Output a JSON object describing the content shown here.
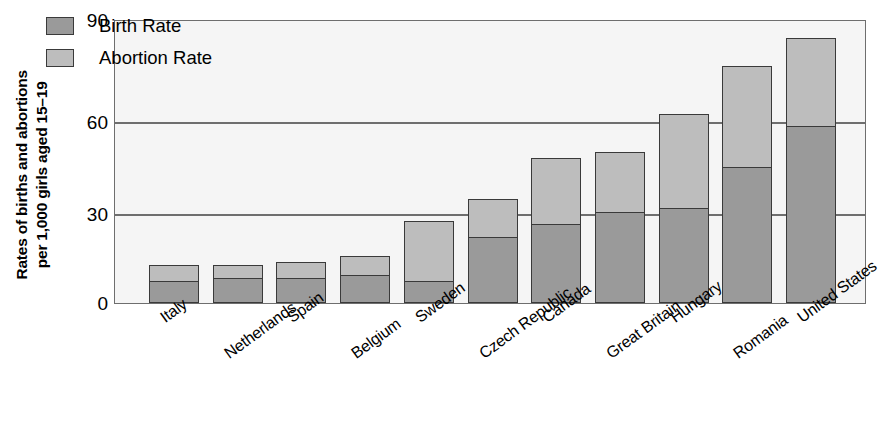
{
  "chart_data": {
    "type": "bar",
    "subtype": "stacked-vertical",
    "title": "",
    "xlabel": "",
    "ylabel": "Rates of births and abortions\nper 1,000 girls aged 15–19",
    "ylim": [
      0,
      90
    ],
    "yticks": [
      0,
      30,
      60,
      90
    ],
    "ytick_labels": [
      "0",
      "30",
      "60",
      "90"
    ],
    "grid": "horizontal",
    "legend_position": "top-left-inside",
    "categories": [
      "Italy",
      "Netherlands",
      "Spain",
      "Belgium",
      "Sweden",
      "Czech Republic",
      "Canada",
      "Great Britain",
      "Hungary",
      "Romania",
      "United States"
    ],
    "series": [
      {
        "name": "Birth Rate",
        "color": "#9a9a9a",
        "values": [
          7,
          8,
          8,
          9,
          7,
          21,
          25,
          29,
          30,
          43,
          56
        ]
      },
      {
        "name": "Abortion Rate",
        "color": "#bdbdbd",
        "values": [
          5,
          4,
          5,
          6,
          19,
          12,
          21,
          19,
          30,
          32,
          28
        ]
      }
    ],
    "totals": [
      12,
      12,
      13,
      15,
      26,
      33,
      46,
      48,
      60,
      75,
      84
    ]
  },
  "legend": {
    "items": [
      {
        "label": "Birth Rate",
        "swatch": "birth"
      },
      {
        "label": "Abortion Rate",
        "swatch": "abortion"
      }
    ]
  },
  "axis": {
    "y_title": "Rates of births and abortions\nper 1,000 girls aged 15–19",
    "y_tick_0": "0",
    "y_tick_1": "30",
    "y_tick_2": "60",
    "y_tick_3": "90"
  },
  "colors": {
    "birth_rate": "#9a9a9a",
    "abortion_rate": "#bdbdbd",
    "plot_background": "#f5f5f5",
    "axis_line": "#6e6e6e",
    "bar_border": "#3a3a3a",
    "page_background": "#ffffff"
  }
}
